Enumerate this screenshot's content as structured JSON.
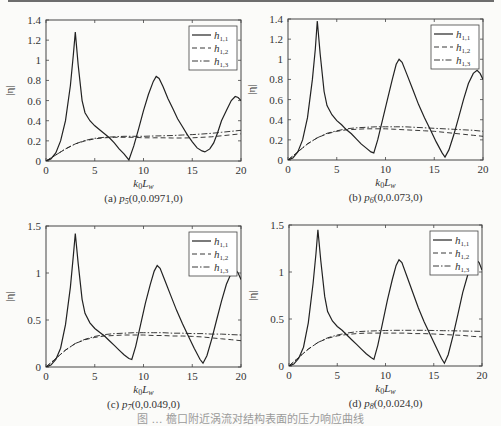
{
  "figure_caption": "图 … 檐口附近涡流对结构表面的压力响应曲线",
  "chart_data": [
    {
      "id": "a",
      "type": "line",
      "caption_prefix": "(a) ",
      "caption_point": "p",
      "caption_sub": "5",
      "caption_coords": "(0,0.0971,0)",
      "xlabel": "k0Lw",
      "ylabel": "|η|",
      "xlim": [
        0,
        20
      ],
      "ylim": [
        0,
        1.4
      ],
      "xticks": [
        0,
        5,
        10,
        15,
        20
      ],
      "yticks": [
        0,
        0.2,
        0.4,
        0.6,
        0.8,
        1,
        1.2,
        1.4
      ],
      "grid": false,
      "legend_position": "upper right",
      "legend": [
        "h1,1",
        "h1,2",
        "h1,3"
      ],
      "series": [
        {
          "name": "h1,1",
          "style": "solid",
          "x": [
            0,
            0.5,
            1,
            1.5,
            2,
            2.5,
            2.8,
            3,
            3.3,
            3.7,
            4,
            4.5,
            5,
            5.5,
            6,
            6.5,
            7,
            7.5,
            8,
            8.5,
            9,
            9.5,
            10,
            10.5,
            11,
            11.3,
            11.6,
            12,
            12.5,
            13,
            13.5,
            14,
            14.5,
            15,
            15.5,
            16,
            16.3,
            16.8,
            17.2,
            17.6,
            18,
            18.5,
            19,
            19.4,
            19.7,
            20
          ],
          "y": [
            0,
            0.02,
            0.08,
            0.2,
            0.4,
            0.75,
            1.05,
            1.28,
            0.95,
            0.6,
            0.48,
            0.4,
            0.35,
            0.31,
            0.27,
            0.23,
            0.18,
            0.12,
            0.07,
            0.01,
            0.15,
            0.32,
            0.5,
            0.66,
            0.79,
            0.84,
            0.82,
            0.74,
            0.62,
            0.52,
            0.42,
            0.34,
            0.26,
            0.19,
            0.13,
            0.1,
            0.09,
            0.12,
            0.18,
            0.28,
            0.4,
            0.5,
            0.6,
            0.64,
            0.63,
            0.6
          ]
        },
        {
          "name": "h1,2",
          "style": "dashed",
          "x": [
            0,
            1,
            2,
            3,
            4,
            5,
            6,
            7,
            8,
            9,
            10,
            11,
            12,
            13,
            14,
            15,
            16,
            17,
            18,
            19,
            20
          ],
          "y": [
            0,
            0.06,
            0.12,
            0.17,
            0.2,
            0.22,
            0.23,
            0.235,
            0.235,
            0.235,
            0.23,
            0.23,
            0.23,
            0.228,
            0.228,
            0.23,
            0.235,
            0.24,
            0.25,
            0.26,
            0.27
          ]
        },
        {
          "name": "h1,3",
          "style": "dashdot",
          "x": [
            0,
            1,
            2,
            3,
            4,
            5,
            6,
            7,
            8,
            9,
            10,
            11,
            12,
            13,
            14,
            15,
            16,
            17,
            18,
            19,
            20
          ],
          "y": [
            0,
            0.06,
            0.12,
            0.17,
            0.205,
            0.225,
            0.235,
            0.24,
            0.245,
            0.245,
            0.245,
            0.248,
            0.25,
            0.253,
            0.258,
            0.262,
            0.268,
            0.275,
            0.285,
            0.295,
            0.305
          ]
        }
      ]
    },
    {
      "id": "b",
      "type": "line",
      "caption_prefix": "(b) ",
      "caption_point": "p",
      "caption_sub": "6",
      "caption_coords": "(0,0.073,0)",
      "xlabel": "k0Lw",
      "ylabel": "|η|",
      "xlim": [
        0,
        20
      ],
      "ylim": [
        0,
        1.4
      ],
      "xticks": [
        0,
        5,
        10,
        15,
        20
      ],
      "yticks": [
        0,
        0.2,
        0.4,
        0.6,
        0.8,
        1,
        1.2,
        1.4
      ],
      "grid": false,
      "legend_position": "upper right",
      "legend": [
        "h1,1",
        "h1,2",
        "h1,3"
      ],
      "series": [
        {
          "name": "h1,1",
          "style": "solid",
          "x": [
            0,
            0.5,
            1,
            1.5,
            2,
            2.5,
            2.8,
            3,
            3.3,
            3.7,
            4,
            4.5,
            5,
            5.5,
            6,
            6.5,
            7,
            7.5,
            8,
            8.5,
            8.8,
            9.2,
            9.7,
            10.2,
            10.7,
            11.1,
            11.4,
            11.7,
            12.2,
            12.8,
            13.4,
            14,
            14.6,
            15.2,
            15.8,
            16.1,
            16.5,
            17,
            17.5,
            18,
            18.5,
            19,
            19.4,
            19.7,
            20
          ],
          "y": [
            0,
            0.02,
            0.08,
            0.2,
            0.42,
            0.8,
            1.1,
            1.38,
            1.05,
            0.68,
            0.54,
            0.45,
            0.39,
            0.35,
            0.3,
            0.26,
            0.21,
            0.16,
            0.12,
            0.08,
            0.07,
            0.2,
            0.4,
            0.6,
            0.8,
            0.95,
            1.0,
            0.97,
            0.85,
            0.7,
            0.55,
            0.42,
            0.3,
            0.18,
            0.07,
            0.03,
            0.1,
            0.25,
            0.42,
            0.6,
            0.76,
            0.86,
            0.89,
            0.86,
            0.8
          ]
        },
        {
          "name": "h1,2",
          "style": "dashed",
          "x": [
            0,
            1,
            2,
            3,
            4,
            5,
            6,
            7,
            8,
            9,
            10,
            11,
            12,
            13,
            14,
            15,
            16,
            17,
            18,
            19,
            20
          ],
          "y": [
            0,
            0.08,
            0.16,
            0.22,
            0.26,
            0.285,
            0.3,
            0.305,
            0.31,
            0.31,
            0.31,
            0.305,
            0.3,
            0.295,
            0.29,
            0.285,
            0.275,
            0.265,
            0.255,
            0.245,
            0.235
          ]
        },
        {
          "name": "h1,3",
          "style": "dashdot",
          "x": [
            0,
            1,
            2,
            3,
            4,
            5,
            6,
            7,
            8,
            9,
            10,
            11,
            12,
            13,
            14,
            15,
            16,
            17,
            18,
            19,
            20
          ],
          "y": [
            0,
            0.08,
            0.16,
            0.22,
            0.265,
            0.29,
            0.31,
            0.32,
            0.325,
            0.33,
            0.33,
            0.33,
            0.33,
            0.325,
            0.32,
            0.315,
            0.31,
            0.305,
            0.3,
            0.295,
            0.285
          ]
        }
      ]
    },
    {
      "id": "c",
      "type": "line",
      "caption_prefix": "(c) ",
      "caption_point": "p",
      "caption_sub": "7",
      "caption_coords": "(0,0.049,0)",
      "xlabel": "k0Lw",
      "ylabel": "|η|",
      "xlim": [
        0,
        20
      ],
      "ylim": [
        0,
        1.5
      ],
      "xticks": [
        0,
        5,
        10,
        15,
        20
      ],
      "yticks": [
        0,
        0.5,
        1,
        1.5
      ],
      "grid": false,
      "legend_position": "upper right",
      "legend": [
        "h1,1",
        "h1,2",
        "h1,3"
      ],
      "series": [
        {
          "name": "h1,1",
          "style": "solid",
          "x": [
            0,
            0.5,
            1,
            1.5,
            2,
            2.5,
            2.8,
            3,
            3.3,
            3.7,
            4,
            4.5,
            5,
            5.5,
            6,
            6.5,
            7,
            7.5,
            8,
            8.5,
            8.8,
            9.2,
            9.7,
            10.2,
            10.7,
            11.1,
            11.4,
            11.7,
            12.2,
            12.8,
            13.4,
            14,
            14.6,
            15.2,
            15.8,
            16.1,
            16.5,
            17,
            17.5,
            18,
            18.5,
            19,
            19.4,
            19.7,
            20
          ],
          "y": [
            0,
            0.02,
            0.08,
            0.2,
            0.45,
            0.85,
            1.18,
            1.42,
            1.1,
            0.72,
            0.57,
            0.47,
            0.41,
            0.37,
            0.33,
            0.28,
            0.23,
            0.18,
            0.13,
            0.09,
            0.08,
            0.22,
            0.45,
            0.68,
            0.88,
            1.02,
            1.08,
            1.05,
            0.92,
            0.76,
            0.6,
            0.46,
            0.33,
            0.2,
            0.08,
            0.04,
            0.12,
            0.3,
            0.5,
            0.7,
            0.88,
            1.0,
            1.04,
            1.0,
            0.93
          ]
        },
        {
          "name": "h1,2",
          "style": "dashed",
          "x": [
            0,
            1,
            2,
            3,
            4,
            5,
            6,
            7,
            8,
            9,
            10,
            11,
            12,
            13,
            14,
            15,
            16,
            17,
            18,
            19,
            20
          ],
          "y": [
            0,
            0.09,
            0.18,
            0.25,
            0.29,
            0.315,
            0.33,
            0.335,
            0.34,
            0.34,
            0.34,
            0.335,
            0.335,
            0.33,
            0.33,
            0.325,
            0.32,
            0.31,
            0.3,
            0.29,
            0.28
          ]
        },
        {
          "name": "h1,3",
          "style": "dashdot",
          "x": [
            0,
            1,
            2,
            3,
            4,
            5,
            6,
            7,
            8,
            9,
            10,
            11,
            12,
            13,
            14,
            15,
            16,
            17,
            18,
            19,
            20
          ],
          "y": [
            0,
            0.09,
            0.18,
            0.25,
            0.295,
            0.325,
            0.345,
            0.355,
            0.36,
            0.365,
            0.365,
            0.365,
            0.365,
            0.36,
            0.36,
            0.355,
            0.355,
            0.35,
            0.35,
            0.345,
            0.34
          ]
        }
      ]
    },
    {
      "id": "d",
      "type": "line",
      "caption_prefix": "(d) ",
      "caption_point": "p",
      "caption_sub": "8",
      "caption_coords": "(0,0.024,0)",
      "xlabel": "k0Lw",
      "ylabel": "|η|",
      "xlim": [
        0,
        20
      ],
      "ylim": [
        0,
        1.5
      ],
      "xticks": [
        0,
        5,
        10,
        15,
        20
      ],
      "yticks": [
        0,
        0.5,
        1,
        1.5
      ],
      "grid": false,
      "legend_position": "upper right",
      "legend": [
        "h1,1",
        "h1,2",
        "h1,3"
      ],
      "series": [
        {
          "name": "h1,1",
          "style": "solid",
          "x": [
            0,
            0.5,
            1,
            1.5,
            2,
            2.5,
            2.8,
            3,
            3.3,
            3.7,
            4,
            4.5,
            5,
            5.5,
            6,
            6.5,
            7,
            7.5,
            8,
            8.5,
            8.8,
            9.2,
            9.7,
            10.2,
            10.7,
            11.1,
            11.4,
            11.7,
            12.2,
            12.8,
            13.4,
            14,
            14.6,
            15.2,
            15.8,
            16.1,
            16.5,
            17,
            17.5,
            18,
            18.5,
            19,
            19.4,
            19.7,
            20
          ],
          "y": [
            0,
            0.02,
            0.08,
            0.2,
            0.46,
            0.88,
            1.2,
            1.45,
            1.12,
            0.74,
            0.58,
            0.48,
            0.42,
            0.38,
            0.33,
            0.28,
            0.23,
            0.18,
            0.13,
            0.09,
            0.07,
            0.22,
            0.46,
            0.7,
            0.92,
            1.07,
            1.13,
            1.1,
            0.96,
            0.79,
            0.62,
            0.47,
            0.34,
            0.21,
            0.08,
            0.03,
            0.12,
            0.32,
            0.55,
            0.78,
            0.96,
            1.1,
            1.13,
            1.1,
            1.02
          ]
        },
        {
          "name": "h1,2",
          "style": "dashed",
          "x": [
            0,
            1,
            2,
            3,
            4,
            5,
            6,
            7,
            8,
            9,
            10,
            11,
            12,
            13,
            14,
            15,
            16,
            17,
            18,
            19,
            20
          ],
          "y": [
            0,
            0.09,
            0.18,
            0.25,
            0.295,
            0.32,
            0.335,
            0.345,
            0.35,
            0.35,
            0.35,
            0.35,
            0.35,
            0.345,
            0.345,
            0.34,
            0.335,
            0.33,
            0.325,
            0.315,
            0.31
          ]
        },
        {
          "name": "h1,3",
          "style": "dashdot",
          "x": [
            0,
            1,
            2,
            3,
            4,
            5,
            6,
            7,
            8,
            9,
            10,
            11,
            12,
            13,
            14,
            15,
            16,
            17,
            18,
            19,
            20
          ],
          "y": [
            0,
            0.09,
            0.18,
            0.25,
            0.3,
            0.33,
            0.35,
            0.365,
            0.37,
            0.375,
            0.378,
            0.38,
            0.38,
            0.38,
            0.38,
            0.378,
            0.376,
            0.374,
            0.372,
            0.37,
            0.368
          ]
        }
      ]
    }
  ]
}
